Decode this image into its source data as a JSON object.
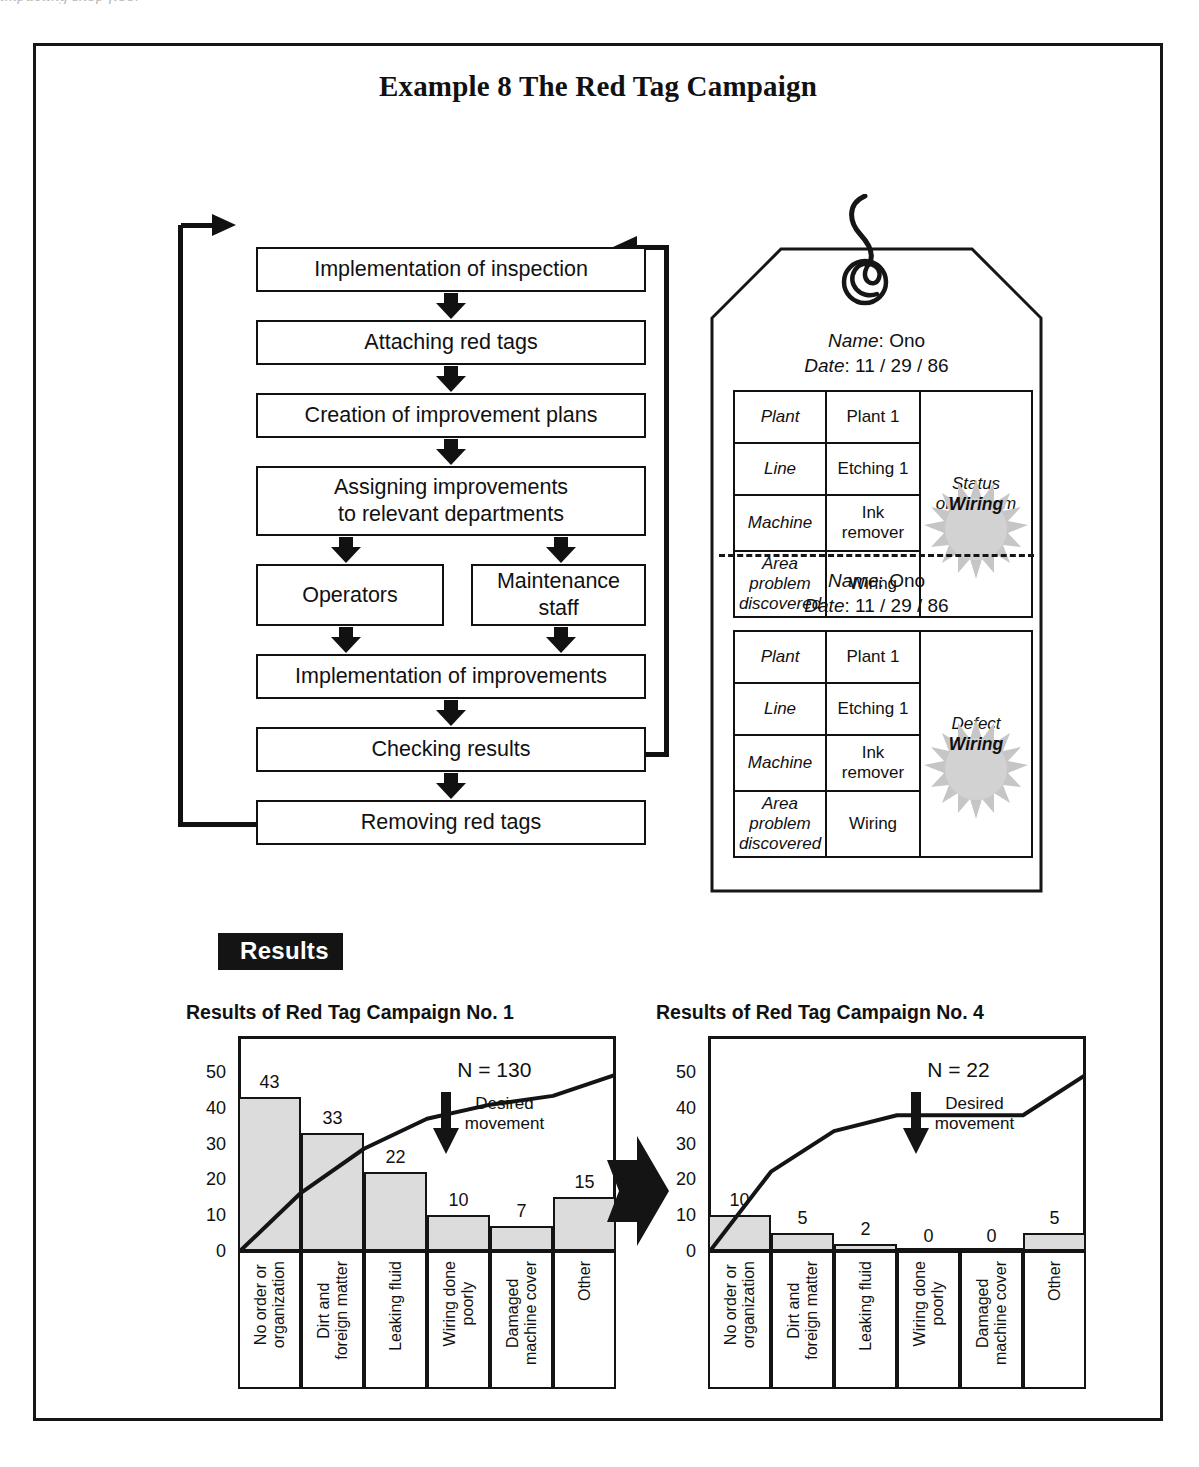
{
  "page": {
    "top_fragment": "impacting shop floor",
    "title": "Example 8  The Red Tag Campaign"
  },
  "flowchart": {
    "steps": [
      {
        "id": "implementation-of-inspection",
        "label": "Implementation of inspection"
      },
      {
        "id": "attaching-red-tags",
        "label": "Attaching red tags"
      },
      {
        "id": "creation-of-improvement-plans",
        "label": "Creation of improvement plans"
      },
      {
        "id": "assigning-improvements",
        "label": "Assigning improvements\nto relevant departments"
      },
      {
        "id": "operators",
        "label": "Operators"
      },
      {
        "id": "maintenance-staff",
        "label": "Maintenance\nstaff"
      },
      {
        "id": "implementation-of-improvements",
        "label": "Implementation of improvements"
      },
      {
        "id": "checking-results",
        "label": "Checking results"
      },
      {
        "id": "removing-red-tags",
        "label": "Removing red tags"
      }
    ]
  },
  "red_tag": {
    "cards": [
      {
        "name_label": "Name",
        "name_value": "Ono",
        "date_label": "Date",
        "date_value": "11 / 29 / 86",
        "status_heading": "Status\nof problem",
        "status_burst": "Wiring",
        "rows": [
          {
            "key": "Plant",
            "value": "Plant 1"
          },
          {
            "key": "Line",
            "value": "Etching 1"
          },
          {
            "key": "Machine",
            "value": "Ink\nremover"
          },
          {
            "key": "Area problem\ndiscovered",
            "value": "Wiring"
          }
        ]
      },
      {
        "name_label": "Name",
        "name_value": "Ono",
        "date_label": "Date",
        "date_value": "11 / 29 / 86",
        "status_heading": "Defect\nstatus",
        "status_burst": "Wiring",
        "rows": [
          {
            "key": "Plant",
            "value": "Plant 1"
          },
          {
            "key": "Line",
            "value": "Etching 1"
          },
          {
            "key": "Machine",
            "value": "Ink\nremover"
          },
          {
            "key": "Area problem\ndiscovered",
            "value": "Wiring"
          }
        ]
      }
    ]
  },
  "results": {
    "banner": "Results"
  },
  "chart_data": [
    {
      "type": "bar",
      "title": "Results of Red Tag Campaign No. 1",
      "categories": [
        "No order or\norganization",
        "Dirt and\nforeign matter",
        "Leaking fluid",
        "Wiring done\npoorly",
        "Damaged\nmachine cover",
        "Other"
      ],
      "values": [
        43,
        33,
        22,
        10,
        7,
        15
      ],
      "cumulative_percent": [
        33,
        58,
        75,
        83,
        88,
        100
      ],
      "ylim": [
        0,
        60
      ],
      "yticks": [
        0,
        10,
        20,
        30,
        40,
        50
      ],
      "ylabel": "",
      "xlabel": "",
      "grid": false,
      "annotations": {
        "n": "N = 130",
        "desired": "Desired\nmovement"
      }
    },
    {
      "type": "bar",
      "title": "Results of Red Tag Campaign No. 4",
      "categories": [
        "No order or\norganization",
        "Dirt and\nforeign matter",
        "Leaking fluid",
        "Wiring done\npoorly",
        "Damaged\nmachine cover",
        "Other"
      ],
      "values": [
        10,
        5,
        2,
        0,
        0,
        5
      ],
      "cumulative_percent": [
        45,
        68,
        77,
        77,
        77,
        100
      ],
      "ylim": [
        0,
        60
      ],
      "yticks": [
        0,
        10,
        20,
        30,
        40,
        50
      ],
      "ylabel": "",
      "xlabel": "",
      "grid": false,
      "annotations": {
        "n": "N = 22",
        "desired": "Desired\nmovement"
      }
    }
  ],
  "icons": {
    "down-block-arrow": "▼",
    "right-block-arrow": "➡",
    "feedback-loop": "↺"
  }
}
